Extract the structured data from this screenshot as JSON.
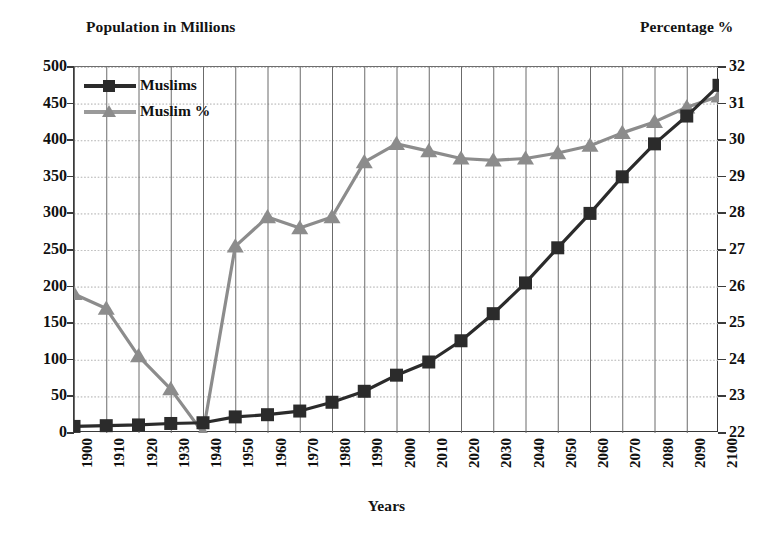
{
  "chart_data": {
    "type": "line",
    "title": "",
    "xlabel": "Years",
    "ylabel": "Population in Millions",
    "y2label": "Percentage %",
    "grid": true,
    "legend_position": "top-left",
    "x": [
      1900,
      1910,
      1920,
      1930,
      1940,
      1950,
      1960,
      1970,
      1980,
      1990,
      2000,
      2010,
      2020,
      2030,
      2040,
      2050,
      2060,
      2070,
      2080,
      2090,
      2100
    ],
    "categories": [
      "1900",
      "1910",
      "1920",
      "1930",
      "1940",
      "1950",
      "1960",
      "1970",
      "1980",
      "1990",
      "2000",
      "2010",
      "2020",
      "2030",
      "2040",
      "2050",
      "2060",
      "2070",
      "2080",
      "2090",
      "2100"
    ],
    "xlim": [
      1900,
      2100
    ],
    "ylim": [
      0,
      500
    ],
    "yticks": [
      0,
      50,
      100,
      150,
      200,
      250,
      300,
      350,
      400,
      450,
      500
    ],
    "y2lim": [
      22,
      32
    ],
    "y2ticks": [
      22,
      23,
      24,
      25,
      26,
      27,
      28,
      29,
      30,
      31,
      32
    ],
    "series": [
      {
        "name": "Muslims",
        "axis": "left",
        "unit": "millions",
        "color": "#2b2b2b",
        "marker": "square",
        "values": [
          9,
          10,
          11,
          13,
          14,
          22,
          25,
          30,
          42,
          57,
          79,
          97,
          126,
          163,
          205,
          253,
          300,
          350,
          395,
          433,
          475
        ]
      },
      {
        "name": "Muslim %",
        "axis": "right",
        "unit": "percent",
        "color": "#8c8c8c",
        "marker": "triangle",
        "values": [
          25.8,
          25.4,
          24.1,
          23.2,
          22.0,
          27.1,
          27.9,
          27.6,
          27.9,
          29.4,
          29.9,
          29.7,
          29.5,
          29.45,
          29.5,
          29.65,
          29.85,
          30.2,
          30.5,
          30.9,
          31.2
        ]
      }
    ]
  },
  "legend": {
    "items": [
      {
        "label": "Muslims",
        "marker": "square",
        "color": "#2b2b2b"
      },
      {
        "label": "Muslim %",
        "marker": "triangle",
        "color": "#8c8c8c"
      }
    ]
  },
  "colors": {
    "muslims": "#2b2b2b",
    "muslim_percent": "#8c8c8c",
    "axis": "#3a3a3a",
    "gridline_major": "#6b6b6b",
    "gridline_minor": "#b9b9b9",
    "background": "#ffffff",
    "text": "#111111"
  }
}
